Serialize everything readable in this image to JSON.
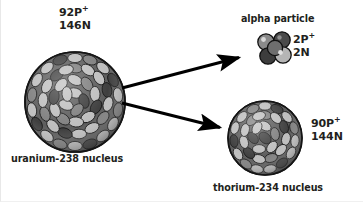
{
  "diagram": {
    "background_color": "#ffffff",
    "text_color": "#231f20",
    "arrow_color": "#000000"
  },
  "palette": {
    "nucleon_light": "#bdbdbd",
    "nucleon_mid": "#7d7d7d",
    "nucleon_dark": "#3b3b3b",
    "nucleon_outline": "#111111",
    "sphere_rim": "#1a1a1a"
  },
  "parent": {
    "name": "uranium-238 nucleus",
    "protons_label": "92P",
    "protons_sup": "+",
    "neutrons_label": "146N",
    "sphere": {
      "cx": 74,
      "cy": 102,
      "r": 50
    }
  },
  "alpha": {
    "title": "alpha particle",
    "protons_label": "2P",
    "protons_sup": "+",
    "neutrons_label": "2N"
  },
  "daughter": {
    "name": "thorium-234 nucleus",
    "protons_label": "90P",
    "protons_sup": "+",
    "neutrons_label": "144N",
    "sphere": {
      "cx": 264,
      "cy": 138,
      "r": 37
    }
  },
  "arrows": [
    {
      "name": "arrow-to-alpha",
      "x1": 121,
      "y1": 88,
      "x2": 243,
      "y2": 56
    },
    {
      "name": "arrow-to-thorium",
      "x1": 121,
      "y1": 103,
      "x2": 224,
      "y2": 129
    }
  ]
}
